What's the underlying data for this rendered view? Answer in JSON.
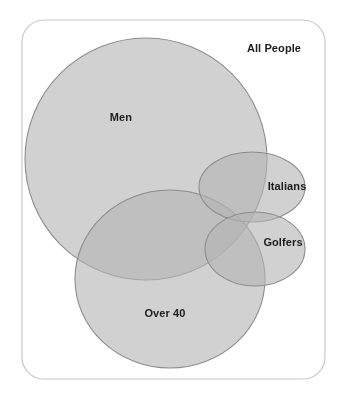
{
  "figure": {
    "title": "All People",
    "background_color": "#ffffff",
    "frame": {
      "label": "All People",
      "stroke_color": "#c8c8c8",
      "fill_color": "#ffffff",
      "corner_radius": 22,
      "x": 22,
      "y": 20,
      "width": 303,
      "height": 359
    }
  },
  "chart_data": {
    "type": "venn",
    "title": "All People",
    "universe_label": "All People",
    "legend_position": "none",
    "grid": false,
    "set_fill_color": "#b4b4b4",
    "set_stroke_color": "#8d8d8d",
    "set_opacity": 0.62,
    "overlap_shading": "multiply",
    "sets": [
      {
        "name": "Men",
        "label": "Men",
        "shape": "ellipse",
        "cx": 146,
        "cy": 159,
        "rx": 121,
        "ry": 121,
        "label_x": 121,
        "label_y": 117,
        "fill": "#b4b4b4",
        "stroke": "#8d8d8d"
      },
      {
        "name": "Over 40",
        "label": "Over 40",
        "shape": "ellipse",
        "cx": 170,
        "cy": 279,
        "rx": 95,
        "ry": 89,
        "label_x": 165,
        "label_y": 313,
        "fill": "#b4b4b4",
        "stroke": "#8d8d8d"
      },
      {
        "name": "Italians",
        "label": "Italians",
        "shape": "ellipse",
        "cx": 252,
        "cy": 187,
        "rx": 53,
        "ry": 35,
        "label_x": 287,
        "label_y": 186,
        "fill": "#b4b4b4",
        "stroke": "#8d8d8d"
      },
      {
        "name": "Golfers",
        "label": "Golfers",
        "shape": "ellipse",
        "cx": 255,
        "cy": 249,
        "rx": 50,
        "ry": 37,
        "label_x": 283,
        "label_y": 242,
        "fill": "#b4b4b4",
        "stroke": "#8d8d8d"
      }
    ],
    "intersections": [
      {
        "sets": [
          "Men",
          "Over 40"
        ],
        "shaded": true
      },
      {
        "sets": [
          "Men",
          "Italians"
        ],
        "shaded": true
      },
      {
        "sets": [
          "Men",
          "Golfers"
        ],
        "shaded": true
      },
      {
        "sets": [
          "Over 40",
          "Italians"
        ],
        "shaded": true
      },
      {
        "sets": [
          "Over 40",
          "Golfers"
        ],
        "shaded": true
      },
      {
        "sets": [
          "Italians",
          "Golfers"
        ],
        "shaded": true
      },
      {
        "sets": [
          "Men",
          "Over 40",
          "Italians"
        ],
        "shaded": true
      },
      {
        "sets": [
          "Men",
          "Over 40",
          "Golfers"
        ],
        "shaded": true
      },
      {
        "sets": [
          "Men",
          "Italians",
          "Golfers"
        ],
        "shaded": true
      },
      {
        "sets": [
          "Men",
          "Over 40",
          "Italians",
          "Golfers"
        ],
        "shaded": true
      }
    ]
  },
  "labels": {
    "all_people": "All People",
    "men": "Men",
    "italians": "Italians",
    "golfers": "Golfers",
    "over_40": "Over 40"
  },
  "colors": {
    "page_background": "#ffffff",
    "frame_stroke": "#c8c8c8",
    "circle_fill": "#b4b4b4",
    "circle_stroke": "#8d8d8d",
    "single_region": "#b4b4b4",
    "double_overlap": "#909090",
    "triple_overlap": "#7c7c7c",
    "light_region": "#d8d8d8",
    "text": "#1c1c1c"
  }
}
